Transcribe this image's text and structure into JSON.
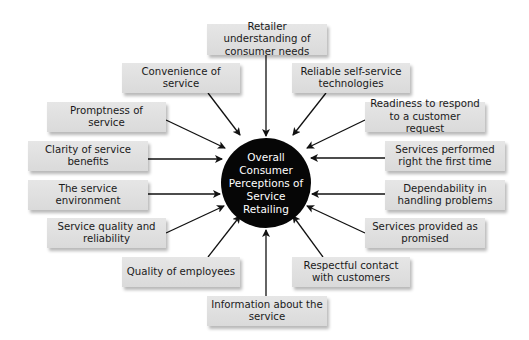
{
  "diagram": {
    "center": {
      "label": "Overall Consumer Perceptions of Service Retailing",
      "fill": "#060606",
      "text_color": "#ffffff"
    },
    "factors": [
      {
        "id": "retailer-understanding",
        "label": "Retailer understanding of consumer needs"
      },
      {
        "id": "convenience",
        "label": "Convenience of service"
      },
      {
        "id": "reliable-self-service",
        "label": "Reliable self-service technologies"
      },
      {
        "id": "promptness",
        "label": "Promptness of service"
      },
      {
        "id": "readiness",
        "label": "Readiness to respond to a customer request"
      },
      {
        "id": "clarity",
        "label": "Clarity of service benefits"
      },
      {
        "id": "performed-right",
        "label": "Services performed right the first time"
      },
      {
        "id": "environment",
        "label": "The service environment"
      },
      {
        "id": "dependability",
        "label": "Dependability in handling problems"
      },
      {
        "id": "quality-reliability",
        "label": "Service quality and reliability"
      },
      {
        "id": "provided-as-promised",
        "label": "Services provided as promised"
      },
      {
        "id": "quality-employees",
        "label": "Quality of employees"
      },
      {
        "id": "respectful-contact",
        "label": "Respectful contact with customers"
      },
      {
        "id": "information",
        "label": "Information about the service"
      }
    ],
    "box_fill": "#e0e0e0",
    "arrow_color": "#111111"
  }
}
